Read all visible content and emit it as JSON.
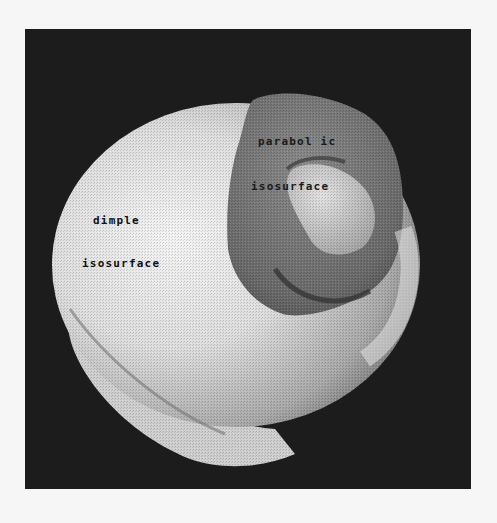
{
  "figure": {
    "background_color": "#f6f6f6",
    "panel_color": "#1c1c1c",
    "surfaces": [
      {
        "name": "dimple isosurface",
        "shade": "light",
        "color": "#e6e6e6"
      },
      {
        "name": "paraboloid isosurface",
        "shade": "dark",
        "color": "#6a6a6a"
      }
    ],
    "labels": {
      "dimple": {
        "line1": "dimple",
        "line2": "isosurface"
      },
      "parabolic": {
        "line1": "parabol ic",
        "line2": "isosurface"
      }
    }
  }
}
